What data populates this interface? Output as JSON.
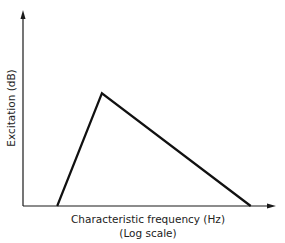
{
  "chart_data": {
    "type": "line",
    "title": "",
    "xlabel": "Characteristic frequency (Hz)",
    "xlabel_note": "(Log scale)",
    "ylabel": "Excitation (dB)",
    "xlim": [
      0,
      1
    ],
    "ylim": [
      0,
      1
    ],
    "grid": false,
    "ticks": false,
    "series": [
      {
        "name": "excitation-pattern",
        "x": [
          0.135,
          0.312,
          0.9
        ],
        "y": [
          0.0,
          0.575,
          0.0
        ]
      }
    ]
  }
}
